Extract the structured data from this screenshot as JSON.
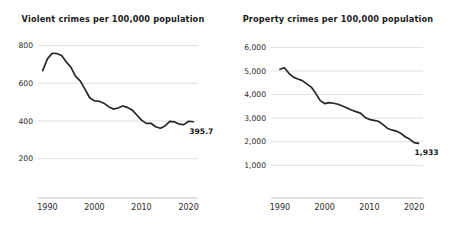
{
  "page": {
    "background": "#ffffff",
    "line_color": "#262626",
    "grid_color": "#d2d2d2",
    "axis_color": "#b8b8b8"
  },
  "chart_data": [
    {
      "type": "line",
      "name": "violent-crimes",
      "title": "Violent crimes per 100,000 population",
      "xlabel": "",
      "ylabel": "",
      "grid": true,
      "legend": "none",
      "xlim": [
        1988,
        2022
      ],
      "ylim": [
        140,
        840
      ],
      "yticks": [
        200,
        400,
        600,
        800
      ],
      "ytick_labels": [
        "200",
        "400",
        "600",
        "800"
      ],
      "xticks": [
        1990,
        2000,
        2010,
        2020
      ],
      "xtick_labels": [
        "1990",
        "2000",
        "2010",
        "2020"
      ],
      "end_label": "395.7",
      "x": [
        1989,
        1990,
        1991,
        1992,
        1993,
        1994,
        1995,
        1996,
        1997,
        1998,
        1999,
        2000,
        2001,
        2002,
        2003,
        2004,
        2005,
        2006,
        2007,
        2008,
        2009,
        2010,
        2011,
        2012,
        2013,
        2014,
        2015,
        2016,
        2017,
        2018,
        2019,
        2020,
        2021
      ],
      "values": [
        666.9,
        729.6,
        758.2,
        757.7,
        747.1,
        713.6,
        684.5,
        636.6,
        611.0,
        567.6,
        523.0,
        506.5,
        504.5,
        494.4,
        475.8,
        463.2,
        469.0,
        479.3,
        471.8,
        458.6,
        431.9,
        404.5,
        387.1,
        387.8,
        369.1,
        361.6,
        373.7,
        397.5,
        394.9,
        383.4,
        380.8,
        398.5,
        395.7
      ]
    },
    {
      "type": "line",
      "name": "property-crimes",
      "title": "Property crimes per 100,000 population",
      "xlabel": "",
      "ylabel": "",
      "grid": true,
      "legend": "none",
      "xlim": [
        1988,
        2022
      ],
      "ylim": [
        800,
        6400
      ],
      "yticks": [
        1000,
        2000,
        3000,
        4000,
        5000,
        6000
      ],
      "ytick_labels": [
        "1,000",
        "2,000",
        "3,000",
        "4,000",
        "5,000",
        "6,000"
      ],
      "xticks": [
        1990,
        2000,
        2010,
        2020
      ],
      "xtick_labels": [
        "1990",
        "2000",
        "2010",
        "2020"
      ],
      "end_label": "1,933",
      "x": [
        1990,
        1991,
        1992,
        1993,
        1994,
        1995,
        1996,
        1997,
        1998,
        1999,
        2000,
        2001,
        2002,
        2003,
        2004,
        2005,
        2006,
        2007,
        2008,
        2009,
        2010,
        2011,
        2012,
        2013,
        2014,
        2015,
        2016,
        2017,
        2018,
        2019,
        2020,
        2021
      ],
      "values": [
        5073.1,
        5140.2,
        4903.7,
        4740.0,
        4660.2,
        4590.5,
        4451.0,
        4316.3,
        4052.5,
        3743.6,
        3618.3,
        3658.1,
        3630.6,
        3591.2,
        3514.1,
        3431.5,
        3346.6,
        3276.4,
        3214.6,
        3041.3,
        2945.9,
        2905.4,
        2868.0,
        2733.6,
        2574.1,
        2500.5,
        2451.6,
        2362.2,
        2209.8,
        2109.9,
        1958.2,
        1933.0
      ]
    }
  ]
}
